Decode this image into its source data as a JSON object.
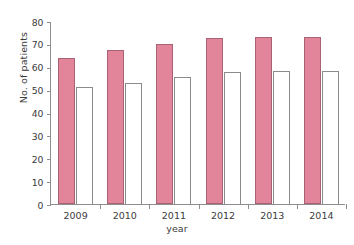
{
  "chart_data": {
    "type": "bar",
    "title": "",
    "xlabel": "year",
    "ylabel": "No. of patients",
    "categories": [
      "2009",
      "2010",
      "2011",
      "2012",
      "2013",
      "2014"
    ],
    "ylim": [
      0,
      80
    ],
    "yticks": [
      0,
      10,
      20,
      30,
      40,
      50,
      60,
      70,
      80
    ],
    "ytick_labels": [
      "0",
      "10",
      "20",
      "30",
      "40",
      "50",
      "60",
      "70",
      "80"
    ],
    "grid": false,
    "legend": "none",
    "series": [
      {
        "name": "series-1",
        "style": "filled-pink",
        "color": "#e2859b",
        "edge_color": "#a86274",
        "values": [
          64,
          67.5,
          70,
          72.5,
          73,
          73
        ]
      },
      {
        "name": "series-2",
        "style": "open-white",
        "color": "#ffffff",
        "edge_color": "#8b8b8b",
        "values": [
          51,
          53,
          55.5,
          57.5,
          58,
          58
        ]
      }
    ]
  },
  "axes": {
    "axis_color": "#8e8e8e",
    "text_color": "#3b3b3b"
  }
}
